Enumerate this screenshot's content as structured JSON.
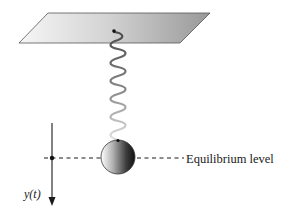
{
  "diagram": {
    "type": "mass-spring system",
    "labels": {
      "equilibrium": "Equilibrium level",
      "displacement_var": "y",
      "displacement_arg": "(t)"
    },
    "elements": {
      "ceiling": "support plane",
      "spring": "coiled spring",
      "mass": "spherical mass",
      "axis": "vertical displacement axis (positive downward)",
      "equilibrium_line": "dashed equilibrium line"
    },
    "colors": {
      "plane_light": "#f4f4f4",
      "plane_dark": "#9a9a9a",
      "spring_dark": "#555555",
      "spring_light": "#dcdcdc",
      "ball_light": "#ffffff",
      "ball_dark": "#1e1e1e",
      "line": "#1a1a1a"
    }
  }
}
